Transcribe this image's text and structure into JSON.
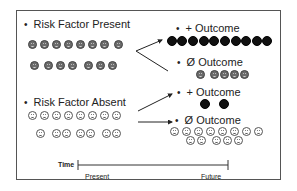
{
  "diagram": {
    "type": "cohort-study-schematic",
    "colors": {
      "risk_present_face": "#6b6b6b",
      "risk_absent_face": "#ffffff",
      "positive_outcome": "#111111",
      "frame": "#555555"
    },
    "groups": [
      {
        "id": "risk-present",
        "label": "Risk Factor Present",
        "face_style": "gray",
        "count": 15,
        "rows": [
          8,
          7
        ],
        "outcomes": [
          {
            "id": "present-positive",
            "label": "+ Outcome",
            "count": 10,
            "style": "black"
          },
          {
            "id": "present-null",
            "label": "Ø Outcome",
            "count": 5,
            "style": "gray"
          }
        ]
      },
      {
        "id": "risk-absent",
        "label": "Risk Factor Absent",
        "face_style": "white",
        "count": 15,
        "rows": [
          8,
          7
        ],
        "outcomes": [
          {
            "id": "absent-positive",
            "label": "+ Outcome",
            "count": 2,
            "style": "black"
          },
          {
            "id": "absent-null",
            "label": "Ø Outcome",
            "count": 13,
            "style": "white",
            "rows": [
              8,
              5
            ]
          }
        ]
      }
    ],
    "bullet": "•",
    "timeline": {
      "title": "Time",
      "start_label": "Present",
      "end_label": "Future"
    }
  }
}
